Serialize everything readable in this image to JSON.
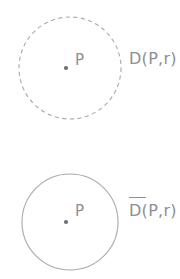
{
  "figure": {
    "background_color": "#ffffff",
    "stroke_color": "#a9a9b0",
    "text_color": "#8e8e94",
    "width": 180,
    "height": 279,
    "panels": [
      {
        "name": "open-disk",
        "boundary_style": "dashed",
        "center_x": 70,
        "center_y": 68,
        "radius": 51,
        "center_point_label": "P",
        "disk_label": "D(P,r)",
        "has_overbar": false
      },
      {
        "name": "closed-disk",
        "boundary_style": "solid",
        "center_x": 70,
        "center_y": 222,
        "radius": 48,
        "center_point_label": "P",
        "disk_label": "D(P,r)",
        "has_overbar": true
      }
    ]
  }
}
